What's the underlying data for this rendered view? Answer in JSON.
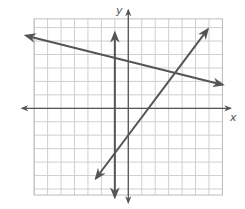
{
  "chart_data": {
    "type": "line",
    "title": "",
    "xlabel": "x",
    "ylabel": "y",
    "grid": true,
    "grid_x_range": [
      -7,
      7
    ],
    "grid_y_range": [
      -6.45,
      6.65
    ],
    "x_axis_extent": [
      -7.9,
      7.6
    ],
    "y_axis_extent": [
      -7.0,
      7.3
    ],
    "tick_labels": [],
    "series": [
      {
        "name": "vertical-line-x-neg1",
        "kind": "vertical",
        "x": -1,
        "y_range": [
          -6.6,
          5.6
        ],
        "arrows": "both"
      },
      {
        "name": "decreasing-line",
        "kind": "linear",
        "slope": -0.25,
        "intercept": 3.5,
        "x_range": [
          -7.6,
          7.0
        ],
        "arrows": "both"
      },
      {
        "name": "increasing-line",
        "kind": "linear",
        "slope": 1.3333,
        "intercept": -2,
        "x_range": [
          -2.4,
          5.9
        ],
        "arrows": "both"
      }
    ],
    "colors": {
      "grid": "#cfcfcf",
      "grid_border": "#bdbdbd",
      "axes": "#555555",
      "lines": "#555555"
    }
  }
}
